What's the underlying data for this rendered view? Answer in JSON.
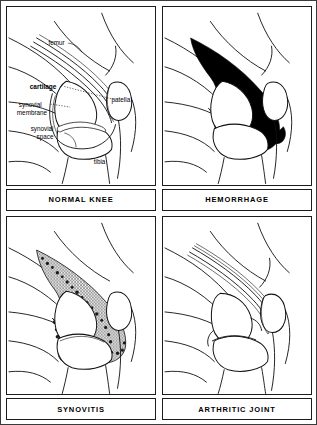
{
  "figure": {
    "panel_count": 4,
    "colors": {
      "ink": "#111111",
      "blood_fill": "#000000",
      "synovium_fill": "#9a9a9a",
      "background": "#ffffff",
      "border": "#1c1c1c"
    }
  },
  "panels": [
    {
      "id": "normal-knee",
      "caption": "NORMAL KNEE",
      "labels": [
        {
          "key": "femur",
          "text": "femur",
          "bold": false
        },
        {
          "key": "cartilage",
          "text": "cartilage",
          "bold": true
        },
        {
          "key": "synovial_membrane",
          "text": "synovial",
          "bold": false
        },
        {
          "key": "synovial_membrane2",
          "text": "membrane",
          "bold": false
        },
        {
          "key": "synovial_space",
          "text": "synovial",
          "bold": false
        },
        {
          "key": "synovial_space2",
          "text": "space",
          "bold": false
        },
        {
          "key": "patella",
          "text": "patella",
          "bold": false
        },
        {
          "key": "tibia",
          "text": "tibia",
          "bold": false
        }
      ]
    },
    {
      "id": "hemorrhage",
      "caption": "HEMORRHAGE",
      "labels": []
    },
    {
      "id": "synovitis",
      "caption": "SYNOVITIS",
      "labels": []
    },
    {
      "id": "arthritic-joint",
      "caption": "ARTHRITIC JOINT",
      "labels": []
    }
  ]
}
